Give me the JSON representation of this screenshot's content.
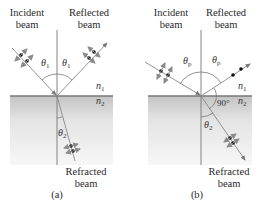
{
  "panels": [
    {
      "id": "a",
      "caption": "(a)",
      "incident_label": [
        "Incident",
        "beam"
      ],
      "reflected_label": [
        "Reflected",
        "beam"
      ],
      "refracted_label": [
        "Refracted",
        "beam"
      ],
      "angle_incident": "θ",
      "angle_incident_sub": "1",
      "angle_reflected": "θ",
      "angle_reflected_sub": "1",
      "angle_refracted": "θ",
      "angle_refracted_sub": "2",
      "medium_top": "n",
      "medium_top_sub": "1",
      "medium_bottom": "n",
      "medium_bottom_sub": "2"
    },
    {
      "id": "b",
      "caption": "(b)",
      "incident_label": [
        "Incident",
        "beam"
      ],
      "reflected_label": [
        "Reflected",
        "beam"
      ],
      "refracted_label": [
        "Refracted",
        "beam"
      ],
      "angle_incident": "θ",
      "angle_incident_sub": "p",
      "angle_reflected": "θ",
      "angle_reflected_sub": "p",
      "angle_refracted": "θ",
      "angle_refracted_sub": "2",
      "right_angle": "90°",
      "medium_top": "n",
      "medium_top_sub": "1",
      "medium_bottom": "n",
      "medium_bottom_sub": "2"
    }
  ],
  "colors": {
    "line": "#6b6b6b",
    "interface": "#777777",
    "medium_top": "#c9c9c9",
    "medium_bottom": "#ffffff",
    "polarization_arrow": "#8a8a8a",
    "dot": "#111111"
  }
}
